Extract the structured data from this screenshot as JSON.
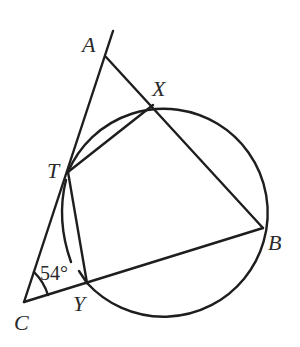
{
  "diagram": {
    "type": "geometry",
    "points": {
      "A": {
        "label": "A",
        "x": 106,
        "y": 57
      },
      "X": {
        "label": "X",
        "x": 153,
        "y": 105
      },
      "T": {
        "label": "T",
        "x": 68,
        "y": 172
      },
      "B": {
        "label": "B",
        "x": 263,
        "y": 228
      },
      "Y": {
        "label": "Y",
        "x": 87,
        "y": 283
      },
      "C": {
        "label": "C",
        "x": 24,
        "y": 302
      }
    },
    "circle": {
      "cx": 163,
      "cy": 210,
      "r": 104
    },
    "angle_C": {
      "label": "54°",
      "vertex": "C",
      "value_deg": 54
    },
    "segments": [
      "CA (extended beyond A)",
      "AB",
      "CB",
      "TX",
      "TY"
    ],
    "colors": {
      "stroke": "#1e1e1e",
      "text": "#2a2a2a",
      "background": "#ffffff"
    }
  },
  "labels": {
    "A": "A",
    "X": "X",
    "T": "T",
    "B": "B",
    "Y": "Y",
    "C": "C",
    "angle": "54°"
  }
}
